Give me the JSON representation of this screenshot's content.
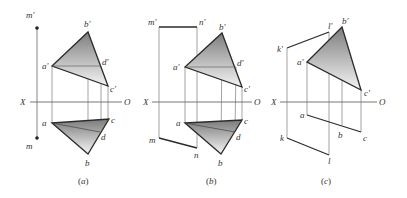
{
  "figure": {
    "width": 407,
    "height": 198,
    "colors": {
      "edge": "#2b2b2b",
      "thin": "#555555",
      "fill_dark": "#8a8a8a",
      "fill_light": "#f2f2f2",
      "text": "#333333"
    },
    "axis_labels": {
      "x": "X",
      "o": "O"
    },
    "panels": [
      {
        "id": "a",
        "caption": "(a)",
        "caption_letter": "a",
        "axis": {
          "y": 102,
          "x1": 30,
          "x2": 122,
          "x_label_x": 22,
          "o_label_x": 125
        },
        "v_triangle": {
          "a": [
            52,
            66
          ],
          "b": [
            88,
            32
          ],
          "c": [
            108,
            86
          ],
          "d": [
            101,
            66
          ]
        },
        "h_triangle": {
          "a": [
            52,
            123
          ],
          "b": [
            88,
            154
          ],
          "c": [
            109,
            119
          ],
          "d": [
            100,
            132
          ]
        },
        "labels": [
          {
            "text": "m'",
            "x": 26,
            "y": 18
          },
          {
            "text": "b'",
            "x": 84,
            "y": 27
          },
          {
            "text": "a'",
            "x": 42,
            "y": 69
          },
          {
            "text": "d'",
            "x": 102,
            "y": 65
          },
          {
            "text": "c'",
            "x": 110,
            "y": 92
          },
          {
            "text": "a",
            "x": 42,
            "y": 126
          },
          {
            "text": "c",
            "x": 111,
            "y": 123
          },
          {
            "text": "d",
            "x": 101,
            "y": 140
          },
          {
            "text": "m",
            "x": 26,
            "y": 149
          },
          {
            "text": "b",
            "x": 85,
            "y": 166
          }
        ],
        "extras": {
          "m_line": {
            "x": 37,
            "y1": 28,
            "y2": 138
          }
        }
      },
      {
        "id": "b",
        "caption": "(b)",
        "caption_letter": "b",
        "axis": {
          "y": 102,
          "x1": 152,
          "x2": 252,
          "x_label_x": 143,
          "o_label_x": 255
        },
        "v_triangle": {
          "a": [
            185,
            67
          ],
          "b": [
            222,
            33
          ],
          "c": [
            242,
            87
          ],
          "d": [
            236,
            67
          ]
        },
        "h_triangle": {
          "a": [
            185,
            123
          ],
          "b": [
            221,
            154
          ],
          "c": [
            242,
            120
          ],
          "d": [
            235,
            132
          ]
        },
        "labels": [
          {
            "text": "m'",
            "x": 148,
            "y": 29
          },
          {
            "text": "n'",
            "x": 199,
            "y": 29
          },
          {
            "text": "b'",
            "x": 219,
            "y": 30
          },
          {
            "text": "a'",
            "x": 173,
            "y": 70
          },
          {
            "text": "d'",
            "x": 237,
            "y": 66
          },
          {
            "text": "c'",
            "x": 244,
            "y": 92
          },
          {
            "text": "a",
            "x": 176,
            "y": 126
          },
          {
            "text": "c",
            "x": 244,
            "y": 124
          },
          {
            "text": "d",
            "x": 236,
            "y": 140
          },
          {
            "text": "m",
            "x": 149,
            "y": 143
          },
          {
            "text": "n",
            "x": 194,
            "y": 158
          },
          {
            "text": "b",
            "x": 218,
            "y": 166
          }
        ],
        "extras": {
          "mn_v": {
            "m": [
              159,
              27
            ],
            "n": [
              197,
              27
            ]
          },
          "mn_h": {
            "m": [
              159,
              138
            ],
            "n": [
              197,
              148
            ]
          }
        }
      },
      {
        "id": "c",
        "caption": "(c)",
        "caption_letter": "c",
        "axis": {
          "y": 102,
          "x1": 280,
          "x2": 377,
          "x_label_x": 271,
          "o_label_x": 379
        },
        "v_triangle": {
          "a": [
            307,
            62
          ],
          "b": [
            342,
            27
          ],
          "c": [
            361,
            90
          ]
        },
        "h_line": {
          "a": [
            307,
            115
          ],
          "b": [
            342,
            125
          ],
          "c": [
            361,
            132
          ]
        },
        "labels": [
          {
            "text": "l'",
            "x": 329,
            "y": 30
          },
          {
            "text": "b'",
            "x": 342,
            "y": 24
          },
          {
            "text": "k'",
            "x": 278,
            "y": 52
          },
          {
            "text": "a'",
            "x": 297,
            "y": 65
          },
          {
            "text": "c'",
            "x": 364,
            "y": 96
          },
          {
            "text": "a",
            "x": 300,
            "y": 118
          },
          {
            "text": "b",
            "x": 338,
            "y": 138
          },
          {
            "text": "c",
            "x": 363,
            "y": 141
          },
          {
            "text": "k",
            "x": 280,
            "y": 141
          },
          {
            "text": "l",
            "x": 328,
            "y": 164
          }
        ],
        "extras": {
          "kl_v": {
            "k": [
              287,
              48
            ],
            "l": [
              329,
              32
            ]
          },
          "kl_h": {
            "k": [
              287,
              138
            ],
            "l": [
              329,
              155
            ]
          }
        }
      }
    ]
  }
}
